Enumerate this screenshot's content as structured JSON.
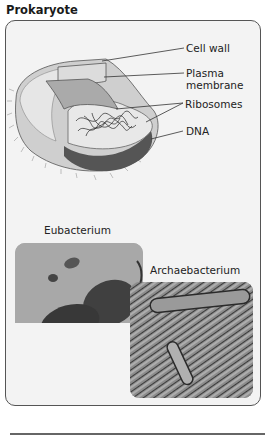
{
  "title": "Prokaryote",
  "diagram": {
    "labels": {
      "cell_wall": "Cell wall",
      "plasma_membrane_1": "Plasma",
      "plasma_membrane_2": "membrane",
      "ribosomes": "Ribosomes",
      "dna": "DNA"
    }
  },
  "photos": {
    "eubacterium_label": "Eubacterium",
    "archaebacterium_label": "Archaebacterium"
  }
}
